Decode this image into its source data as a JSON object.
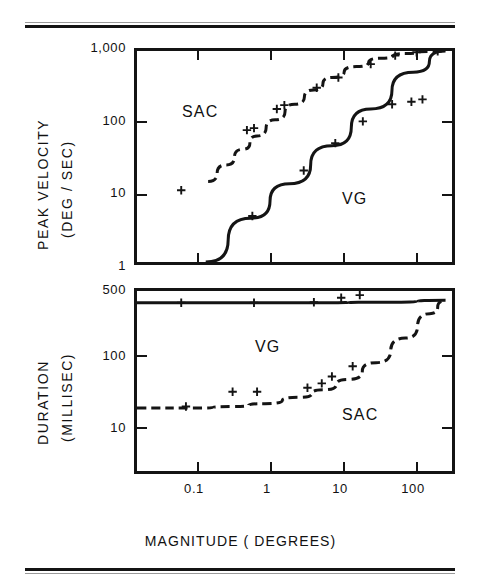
{
  "figure": {
    "x_axis_title": "MAGNITUDE ( DEGREES)",
    "panels": [
      {
        "id": "peak-velocity",
        "y_axis_title_line1": "PEAK  VELOCITY",
        "y_axis_title_line2": "(DEG / SEC)",
        "y_ticks": [
          "1,000",
          "100",
          "10",
          "1"
        ],
        "x_ticks": [
          "0.1",
          "1",
          "10",
          "100"
        ],
        "series_labels": [
          "SAC",
          "VG"
        ]
      },
      {
        "id": "duration",
        "y_axis_title_line1": "DURATION",
        "y_axis_title_line2": "(MILLISEC)",
        "y_ticks": [
          "500",
          "100",
          "10"
        ],
        "x_ticks": [
          "0.1",
          "1",
          "10",
          "100"
        ],
        "series_labels": [
          "VG",
          "SAC"
        ]
      }
    ]
  },
  "chart_data": [
    {
      "type": "line",
      "title": "",
      "panel": "peak-velocity",
      "xlabel": "MAGNITUDE ( DEGREES)",
      "ylabel": "PEAK VELOCITY (DEG / SEC)",
      "xscale": "log",
      "yscale": "log",
      "xlim": [
        0.04,
        300
      ],
      "ylim": [
        1,
        1000
      ],
      "xticks": [
        0.1,
        1,
        10,
        100
      ],
      "xticklabels": [
        "0.1",
        "1",
        "10",
        "100"
      ],
      "yticks": [
        1,
        10,
        100,
        1000
      ],
      "yticklabels": [
        "1",
        "10",
        "100",
        "1,000"
      ],
      "grid": false,
      "legend": "inline-annotation",
      "series": [
        {
          "name": "SAC",
          "style": "dashed",
          "annotation_xy": [
            0.55,
            230
          ],
          "line": {
            "x": [
              0.3,
              0.5,
              0.8,
              1.2,
              2,
              3.5,
              6,
              10,
              20,
              40,
              80,
              150,
              250
            ],
            "y": [
              14,
              24,
              40,
              62,
              105,
              175,
              280,
              420,
              600,
              790,
              920,
              985,
              1000
            ]
          },
          "points": {
            "x": [
              0.14,
              0.9,
              1.1,
              2.1,
              2.6,
              6.5,
              12,
              30,
              60,
              110,
              200
            ],
            "y": [
              10.5,
              75,
              80,
              150,
              170,
              300,
              420,
              650,
              860,
              960,
              990
            ]
          }
        },
        {
          "name": "VG",
          "style": "solid",
          "annotation_xy": [
            22,
            11
          ],
          "line": {
            "x": [
              0.28,
              1,
              3,
              10,
              30,
              100,
              250
            ],
            "y": [
              1.0,
              4.2,
              13,
              45,
              150,
              500,
              1000
            ]
          },
          "points": {
            "x": [
              1.05,
              4.5,
              11,
              24,
              55,
              95,
              130
            ],
            "y": [
              4.5,
              20,
              49,
              100,
              175,
              190,
              205
            ]
          }
        }
      ]
    },
    {
      "type": "line",
      "title": "",
      "panel": "duration",
      "xlabel": "MAGNITUDE ( DEGREES)",
      "ylabel": "DURATION (MILLISEC)",
      "xscale": "log",
      "yscale": "log",
      "xlim": [
        0.04,
        300
      ],
      "ylim": [
        5,
        500
      ],
      "xticks": [
        0.1,
        1,
        10,
        100
      ],
      "xticklabels": [
        "0.1",
        "1",
        "10",
        "100"
      ],
      "yticks": [
        10,
        100,
        500
      ],
      "yticklabels": [
        "10",
        "100",
        "500"
      ],
      "grid": false,
      "legend": "inline-annotation",
      "series": [
        {
          "name": "VG",
          "style": "solid",
          "annotation_xy": [
            1.3,
            170
          ],
          "line": {
            "x": [
              0.04,
              0.5,
              5,
              50,
              250
            ],
            "y": [
              370,
              370,
              370,
              375,
              395
            ]
          },
          "points": {
            "x": [
              0.14,
              1.1,
              6,
              13,
              22
            ],
            "y": [
              370,
              370,
              375,
              420,
              450
            ]
          }
        },
        {
          "name": "SAC",
          "style": "dashed",
          "annotation_xy": [
            22,
            26
          ],
          "line": {
            "x": [
              0.04,
              0.2,
              0.6,
              1.5,
              4,
              8,
              16,
              35,
              80,
              160,
              250
            ],
            "y": [
              25,
              25,
              26,
              28,
              33,
              40,
              52,
              80,
              150,
              280,
              390
            ]
          },
          "points": {
            "x": [
              0.16,
              0.6,
              1.2,
              5,
              7.5,
              10,
              18
            ],
            "y": [
              26,
              38,
              38,
              42,
              47,
              56,
              73
            ]
          }
        }
      ]
    }
  ]
}
